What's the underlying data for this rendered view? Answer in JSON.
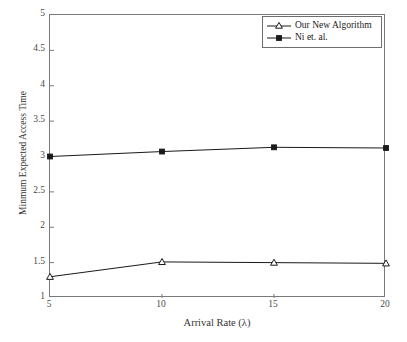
{
  "chart_data": {
    "type": "line",
    "title": "",
    "xlabel": "Arrival Rate (λ)",
    "ylabel": "Minmum Expected Access Time",
    "x": [
      5,
      10,
      15,
      20
    ],
    "xlim": [
      5,
      20
    ],
    "ylim": [
      1,
      5
    ],
    "xticks": [
      "5",
      "10",
      "15",
      "20"
    ],
    "yticks": [
      "1",
      "1.5",
      "2",
      "2.5",
      "3",
      "3.5",
      "4",
      "4.5",
      "5"
    ],
    "ytick_values": [
      1,
      1.5,
      2,
      2.5,
      3,
      3.5,
      4,
      4.5,
      5
    ],
    "grid": false,
    "legend_position": "upper right",
    "series": [
      {
        "name": "Our New Algorithm",
        "marker": "triangle-open",
        "color": "#1a1a1a",
        "values": [
          1.3,
          1.51,
          1.5,
          1.49
        ]
      },
      {
        "name": "Ni et. al.",
        "marker": "square-filled",
        "color": "#1a1a1a",
        "values": [
          3.0,
          3.07,
          3.13,
          3.12
        ]
      }
    ]
  },
  "legend": {
    "entries": [
      {
        "label": "Our New Algorithm"
      },
      {
        "label": "Ni et. al."
      }
    ]
  }
}
